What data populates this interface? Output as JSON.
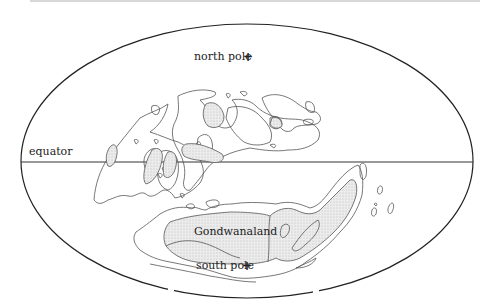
{
  "figure": {
    "projection": "elliptical world map",
    "labels": {
      "north_pole": "north pole",
      "equator": "equator",
      "gondwanaland": "Gondwanaland",
      "south_pole": "south pole"
    },
    "markers": {
      "pole_marker": "+"
    },
    "colors": {
      "outline": "#222222",
      "coastline": "#555555",
      "land_fill": "#e4e4e4",
      "background": "#ffffff"
    }
  }
}
